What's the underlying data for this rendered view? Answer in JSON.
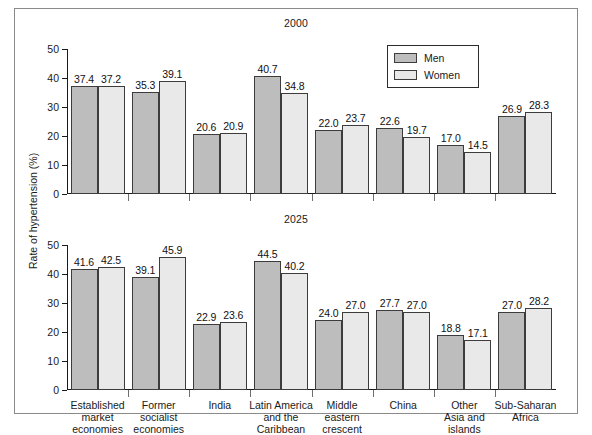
{
  "figure": {
    "ylabel": "Rate of hypertension (%)",
    "legend": {
      "men_label": "Men",
      "women_label": "Women",
      "men_color": "#bdbdbd",
      "women_color": "#e9e9e9"
    }
  },
  "chart_data": {
    "type": "bar",
    "title": "",
    "xlabel": "",
    "ylabel": "Rate of hypertension (%)",
    "ylim": [
      0,
      50
    ],
    "yticks": [
      0,
      10,
      20,
      30,
      40,
      50
    ],
    "grid": false,
    "legend_position": "top-right",
    "legend_entries": [
      "Men",
      "Women"
    ],
    "categories": [
      "Established market economies",
      "Former socialist economies",
      "India",
      "Latin America and the Caribbean",
      "Middle eastern crescent",
      "China",
      "Other Asia and islands",
      "Sub-Saharan Africa"
    ],
    "category_lines": [
      [
        "Established",
        "market",
        "economies"
      ],
      [
        "Former",
        "socialist",
        "economies"
      ],
      [
        "India"
      ],
      [
        "Latin America",
        "and the",
        "Caribbean"
      ],
      [
        "Middle",
        "eastern",
        "crescent"
      ],
      [
        "China"
      ],
      [
        "Other",
        "Asia and",
        "islands"
      ],
      [
        "Sub-Saharan",
        "Africa"
      ]
    ],
    "panels": [
      {
        "title": "2000",
        "series": [
          {
            "name": "Men",
            "values": [
              37.4,
              35.3,
              20.6,
              40.7,
              22.0,
              22.6,
              17.0,
              26.9
            ]
          },
          {
            "name": "Women",
            "values": [
              37.2,
              39.1,
              20.9,
              34.8,
              23.7,
              19.7,
              14.5,
              28.3
            ]
          }
        ]
      },
      {
        "title": "2025",
        "series": [
          {
            "name": "Men",
            "values": [
              41.6,
              39.1,
              22.9,
              44.5,
              24.0,
              27.7,
              18.8,
              27.0
            ]
          },
          {
            "name": "Women",
            "values": [
              42.5,
              45.9,
              23.6,
              40.2,
              27.0,
              27.0,
              17.1,
              28.2
            ]
          }
        ]
      }
    ]
  }
}
